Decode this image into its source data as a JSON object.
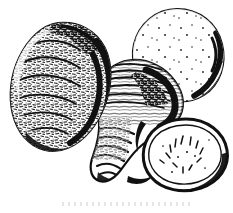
{
  "image": {
    "title": "Ginger rhizomes and cut slices",
    "subject": "ginger-rhizome",
    "style": "black-and-white scanned line drawing with stipple and hatch shading",
    "background_color": "#ffffff",
    "ink_color": "#111111",
    "width": 233,
    "height": 213,
    "has_caption_text": false,
    "has_border": false
  },
  "objects": [
    {
      "id": "tuber-left",
      "label": "Whole ginger rhizome (left)",
      "kind": "whole-tuber",
      "shape": "rounded lumpy oval, tilted",
      "bounds": {
        "x": 10,
        "y": 22,
        "width": 100,
        "height": 130
      },
      "texture": "dense broken stipple and short dashes",
      "outline": "thin broken line on left, heavy dark edge on right"
    },
    {
      "id": "tuber-center",
      "label": "Whole ginger rhizome (center)",
      "kind": "whole-tuber",
      "shape": "elongated pear with tapering tail",
      "bounds": {
        "x": 88,
        "y": 58,
        "width": 95,
        "height": 125
      },
      "texture": "curved horizontal hatch bands and ribbed tail",
      "outline": "solid dark contour with heavy shadow at upper right"
    },
    {
      "id": "slice-top-right",
      "label": "Cut ginger slice (upper right)",
      "kind": "cut-slice",
      "shape": "round cross-section",
      "bounds": {
        "x": 131,
        "y": 8,
        "width": 93,
        "height": 93
      },
      "texture": "sparse interior dots",
      "outline": "thick wavy dark rind on right side"
    },
    {
      "id": "slice-bottom-right",
      "label": "Cut ginger slice (lower right)",
      "kind": "cut-slice",
      "shape": "round cross-section",
      "bounds": {
        "x": 142,
        "y": 118,
        "width": 87,
        "height": 74
      },
      "texture": "radial short dashes clustered near center",
      "outline": "double rind: heavy outer ring plus thin inner line"
    }
  ],
  "colors": {
    "ink": "#111111",
    "shadow": "#000000",
    "paper": "#ffffff"
  }
}
